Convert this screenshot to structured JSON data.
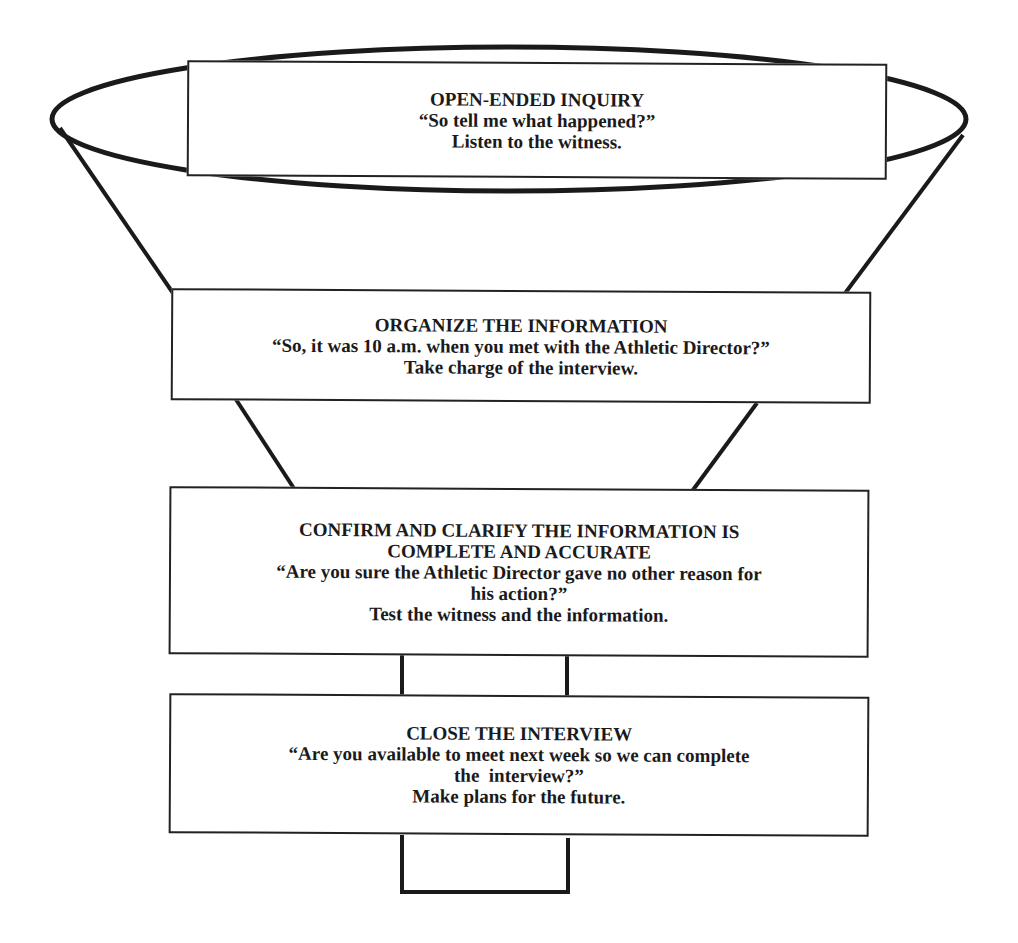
{
  "diagram": {
    "type": "funnel",
    "stages": [
      {
        "heading": [
          "OPEN-ENDED INQUIRY"
        ],
        "quote": [
          "“So tell me what happened?”"
        ],
        "action": "Listen to the witness."
      },
      {
        "heading": [
          "ORGANIZE THE INFORMATION"
        ],
        "quote": [
          "“So, it was 10 a.m. when you met with the Athletic Director?”"
        ],
        "action": "Take charge of the interview."
      },
      {
        "heading": [
          "CONFIRM AND CLARIFY THE INFORMATION IS",
          "COMPLETE AND ACCURATE"
        ],
        "quote": [
          "“Are you sure the Athletic Director gave no other reason for",
          "his action?”"
        ],
        "action": "Test the witness and the information."
      },
      {
        "heading": [
          "CLOSE THE INTERVIEW"
        ],
        "quote": [
          "“Are you available to meet next week so we can complete",
          "the  interview?”"
        ],
        "action": "Make plans for the future."
      }
    ],
    "colors": {
      "stroke": "#1a1a1a",
      "box_border": "#222222",
      "background": "#ffffff"
    }
  }
}
